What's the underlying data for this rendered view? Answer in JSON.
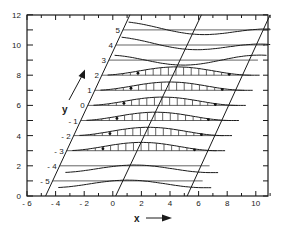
{
  "figure": {
    "xlabel": "x",
    "ylabel": "y",
    "x_ticks": [
      "-6",
      "-4",
      "-2",
      "0",
      "2",
      "4",
      "6",
      "8",
      "10"
    ],
    "y_ticks": [
      "0",
      "2",
      "4",
      "6",
      "8",
      "10",
      "12"
    ],
    "row_labels": [
      "5",
      "4",
      "3",
      "2",
      "1",
      "0",
      "-1",
      "-2",
      "-3",
      "-4",
      "-5"
    ],
    "x_arrow_icon": "right-arrow",
    "y_arrow_icon": "diagonal-up-arrow"
  },
  "chart_data": {
    "type": "line",
    "title": "",
    "xlabel": "x",
    "ylabel": "y",
    "xlim": [
      -6,
      11
    ],
    "ylim": [
      0,
      12
    ],
    "x_ticks": [
      -6,
      -4,
      -2,
      0,
      2,
      4,
      6,
      8,
      10
    ],
    "y_ticks": [
      0,
      2,
      4,
      6,
      8,
      10,
      12
    ],
    "grid": false,
    "sheared_lines": [
      {
        "name": "left",
        "from": [
          -4.7,
          0
        ],
        "to": [
          1.2,
          12
        ]
      },
      {
        "name": "middle",
        "from": [
          0.2,
          0
        ],
        "to": [
          6.2,
          12
        ]
      },
      {
        "name": "right",
        "from": [
          5.2,
          0
        ],
        "to": [
          11,
          12
        ]
      }
    ],
    "rows": [
      {
        "label": "5",
        "baseline_y": 11
      },
      {
        "label": "4",
        "baseline_y": 10
      },
      {
        "label": "3",
        "baseline_y": 9
      },
      {
        "label": "2",
        "baseline_y": 8
      },
      {
        "label": "1",
        "baseline_y": 7
      },
      {
        "label": "0",
        "baseline_y": 6
      },
      {
        "label": "-1",
        "baseline_y": 5
      },
      {
        "label": "-2",
        "baseline_y": 4
      },
      {
        "label": "-3",
        "baseline_y": 3
      },
      {
        "label": "-4",
        "baseline_y": 2
      },
      {
        "label": "-5",
        "baseline_y": 1
      }
    ],
    "annotations": [
      "vertical hatching between baseline and displaced curve for rows 2 to -3",
      "filled dots marking inflection points on rows 2 to -3"
    ]
  }
}
